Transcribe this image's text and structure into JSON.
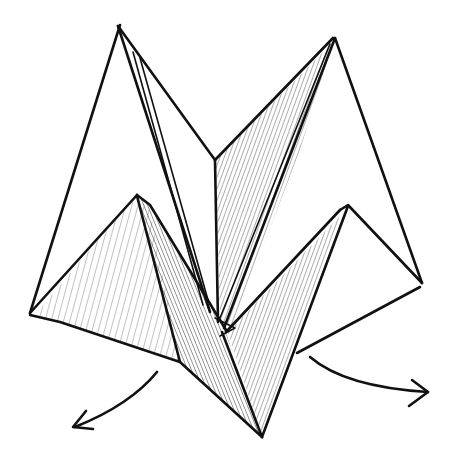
{
  "diagram": {
    "style": "hand-drawn ink sketch with hatching",
    "colors": {
      "ink": "#111111",
      "paper": "#ffffff"
    },
    "shapes": {
      "left_outer_flap": [
        [
          118,
          25
        ],
        [
          30,
          315
        ],
        [
          137,
          195
        ]
      ],
      "left_outer_edge_right": [
        [
          118,
          25
        ],
        [
          215,
          160
        ]
      ],
      "left_inner_crease": [
        [
          118,
          25
        ],
        [
          212,
          315
        ]
      ],
      "left_inner_crease_2": [
        [
          133,
          50
        ],
        [
          205,
          305
        ]
      ],
      "center_vertical": [
        [
          215,
          160
        ],
        [
          218,
          320
        ]
      ],
      "right_outer_flap": [
        [
          335,
          38
        ],
        [
          422,
          283
        ]
      ],
      "right_hatched_panel": [
        [
          215,
          160
        ],
        [
          335,
          38
        ],
        [
          228,
          330
        ],
        [
          218,
          320
        ]
      ],
      "left_hatched_triangle": [
        [
          30,
          315
        ],
        [
          137,
          195
        ],
        [
          180,
          362
        ],
        [
          45,
          318
        ]
      ],
      "left_dark_strip": [
        [
          137,
          195
        ],
        [
          150,
          205
        ],
        [
          262,
          437
        ],
        [
          180,
          362
        ]
      ],
      "right_hatched_triangle": [
        [
          228,
          330
        ],
        [
          348,
          205
        ],
        [
          262,
          437
        ]
      ],
      "right_lower_edges": [
        [
          348,
          205
        ],
        [
          422,
          283
        ],
        [
          297,
          353
        ]
      ]
    },
    "arrows": [
      {
        "name": "left-unfold-arrow",
        "from": [
          157,
          372
        ],
        "to": [
          75,
          427
        ],
        "direction": "down-left"
      },
      {
        "name": "right-unfold-arrow",
        "from": [
          310,
          357
        ],
        "to": [
          428,
          392
        ],
        "direction": "right"
      }
    ]
  }
}
